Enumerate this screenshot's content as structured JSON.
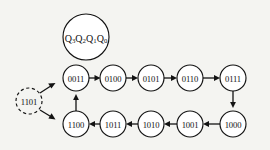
{
  "diagram": {
    "background_color": "#f4f4f1",
    "line_color": "#131313",
    "node_fill": "#ffffff",
    "legend": {
      "name": "state-variable-legend",
      "text": "Q3Q2Q1Q0",
      "parts": [
        {
          "base": "Q",
          "sub": "3"
        },
        {
          "base": "Q",
          "sub": "2"
        },
        {
          "base": "Q",
          "sub": "1"
        },
        {
          "base": "Q",
          "sub": "0"
        }
      ],
      "cx": 86,
      "cy": 37,
      "r": 23
    },
    "nodes": [
      {
        "id": "n0011",
        "label": "0011",
        "cx": 76,
        "cy": 78,
        "r": 13,
        "style": "solid",
        "row": "top"
      },
      {
        "id": "n0100",
        "label": "0100",
        "cx": 113,
        "cy": 78,
        "r": 13,
        "style": "solid",
        "row": "top"
      },
      {
        "id": "n0101",
        "label": "0101",
        "cx": 151,
        "cy": 78,
        "r": 13,
        "style": "solid",
        "row": "top"
      },
      {
        "id": "n0110",
        "label": "0110",
        "cx": 190,
        "cy": 78,
        "r": 13,
        "style": "solid",
        "row": "top"
      },
      {
        "id": "n0111",
        "label": "0111",
        "cx": 233,
        "cy": 78,
        "r": 13,
        "style": "solid",
        "row": "top"
      },
      {
        "id": "n1000",
        "label": "1000",
        "cx": 233,
        "cy": 124,
        "r": 13,
        "style": "solid",
        "row": "bottom"
      },
      {
        "id": "n1001",
        "label": "1001",
        "cx": 190,
        "cy": 124,
        "r": 13,
        "style": "solid",
        "row": "bottom"
      },
      {
        "id": "n1010",
        "label": "1010",
        "cx": 151,
        "cy": 124,
        "r": 13,
        "style": "solid",
        "row": "bottom"
      },
      {
        "id": "n1011",
        "label": "1011",
        "cx": 113,
        "cy": 124,
        "r": 13,
        "style": "solid",
        "row": "bottom"
      },
      {
        "id": "n1100",
        "label": "1100",
        "cx": 76,
        "cy": 124,
        "r": 13,
        "style": "solid",
        "row": "bottom"
      },
      {
        "id": "n1101",
        "label": "1101",
        "cx": 29,
        "cy": 101,
        "r": 13,
        "style": "dashed",
        "row": "unused"
      }
    ],
    "edges": [
      {
        "from": "n0011",
        "to": "n0100",
        "direction": "right"
      },
      {
        "from": "n0100",
        "to": "n0101",
        "direction": "right"
      },
      {
        "from": "n0101",
        "to": "n0110",
        "direction": "right"
      },
      {
        "from": "n0110",
        "to": "n0111",
        "direction": "right"
      },
      {
        "from": "n0111",
        "to": "n1000",
        "direction": "down"
      },
      {
        "from": "n1000",
        "to": "n1001",
        "direction": "left"
      },
      {
        "from": "n1001",
        "to": "n1010",
        "direction": "left"
      },
      {
        "from": "n1010",
        "to": "n1011",
        "direction": "left"
      },
      {
        "from": "n1011",
        "to": "n1100",
        "direction": "left"
      },
      {
        "from": "n1100",
        "to": "n0011",
        "direction": "up"
      },
      {
        "from": "n1101",
        "to": "n0011",
        "direction": "up-right"
      },
      {
        "from": "n1101",
        "to": "n1100",
        "direction": "down-right"
      }
    ]
  }
}
